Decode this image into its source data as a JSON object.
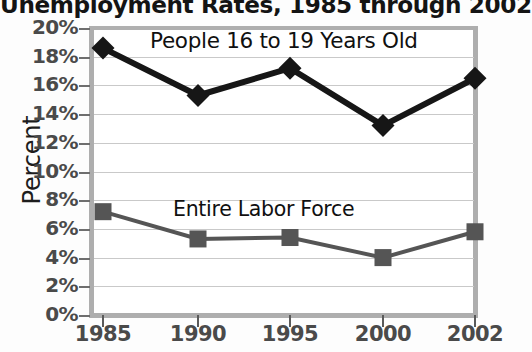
{
  "chart_data": {
    "type": "line",
    "title": "Unemployment Rates, 1985 through 2002",
    "xlabel": "",
    "ylabel": "Percent",
    "x": [
      1985,
      1990,
      1995,
      2000,
      2002
    ],
    "categories": [
      "1985",
      "1990",
      "1995",
      "2000",
      "2002"
    ],
    "ylim": [
      0,
      20
    ],
    "ytick_step": 2,
    "ytick_labels": [
      "20%",
      "18%",
      "16%",
      "14%",
      "12%",
      "10%",
      "8%",
      "6%",
      "4%",
      "2%",
      "0%"
    ],
    "ytick_values": [
      20,
      18,
      16,
      14,
      12,
      10,
      8,
      6,
      4,
      2,
      0
    ],
    "grid": true,
    "legend_position": "inline-annotations",
    "series": [
      {
        "name": "People 16 to 19 Years Old",
        "values": [
          18.6,
          15.3,
          17.2,
          13.2,
          16.5
        ],
        "color": "#161616",
        "marker": "diamond",
        "line_width": 6
      },
      {
        "name": "Entire Labor Force",
        "values": [
          7.2,
          5.3,
          5.4,
          4.0,
          5.8
        ],
        "color": "#555555",
        "marker": "square",
        "line_width": 4
      }
    ],
    "annotations": [
      {
        "text": "People 16 to 19 Years Old",
        "series": 0
      },
      {
        "text": "Entire Labor Force",
        "series": 1
      }
    ]
  },
  "colors": {
    "teens_series": "#161616",
    "labor_series": "#555555",
    "axis_frame": "#aeaeae",
    "gridline": "#c9c9c9",
    "tick_label": "#4a4a4a",
    "plot_background": "#ffffff",
    "page_background": "#fdfdfd"
  }
}
